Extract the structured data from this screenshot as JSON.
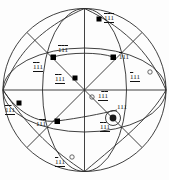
{
  "figure": {
    "type": "stereographic-projection",
    "title": "",
    "primitive_circle": {
      "cx": 84.5,
      "cy": 90,
      "r": 81.5
    },
    "colors": {
      "line": "#2b2b2b",
      "marker": "#000000",
      "background": "#ffffff"
    }
  },
  "geometry": {
    "great_circles": [
      {
        "name": "horizontal-diameter",
        "kind": "line"
      },
      {
        "name": "vertical-diameter",
        "kind": "line"
      },
      {
        "name": "diagonal-ne-sw",
        "kind": "line"
      },
      {
        "name": "diagonal-nw-se",
        "kind": "line"
      },
      {
        "name": "inner-ellipse-horizontal",
        "kind": "ellipse"
      },
      {
        "name": "inner-ellipse-vertical",
        "kind": "ellipse"
      },
      {
        "name": "arc-lens-upper",
        "kind": "arc"
      },
      {
        "name": "arc-lens-lower",
        "kind": "arc"
      }
    ]
  },
  "poles": [
    {
      "id": "p1",
      "label": [
        "1",
        "1",
        "1"
      ],
      "bars": [
        true,
        true,
        true
      ],
      "underline": true,
      "marker": "filled-square",
      "x": 99,
      "y": 19,
      "lx": 104,
      "ly": 15
    },
    {
      "id": "p2",
      "label": [
        "1",
        "1",
        "1"
      ],
      "bars": [
        true,
        true,
        true
      ],
      "underline": false,
      "marker": "filled-square",
      "x": 53,
      "y": 57,
      "lx": 58,
      "ly": 47
    },
    {
      "id": "p3",
      "label": [
        "1",
        "1",
        "1"
      ],
      "bars": [
        true,
        false,
        false
      ],
      "underline": false,
      "marker": "filled-square",
      "x": 113,
      "y": 57,
      "lx": 119,
      "ly": 54
    },
    {
      "id": "p4",
      "label": [
        "1",
        "1",
        "1"
      ],
      "bars": [
        true,
        true,
        false
      ],
      "underline": true,
      "marker": "none",
      "x": 46,
      "y": 66,
      "lx": 41,
      "ly": 64
    },
    {
      "id": "p5",
      "label": [
        "1",
        "1",
        "1"
      ],
      "bars": [
        true,
        false,
        false
      ],
      "underline": true,
      "marker": "open-circle",
      "x": 150,
      "y": 72,
      "lx": 134,
      "ly": 74
    },
    {
      "id": "p6",
      "label": [
        "1",
        "1",
        "1"
      ],
      "bars": [
        true,
        true,
        false
      ],
      "underline": true,
      "marker": "filled-square",
      "x": 75,
      "y": 78,
      "lx": 61,
      "ly": 76
    },
    {
      "id": "p7",
      "label": [
        "1",
        "1",
        "1"
      ],
      "bars": [
        false,
        true,
        true
      ],
      "underline": true,
      "marker": "open-circle",
      "x": 92,
      "y": 97,
      "lx": 98,
      "ly": 93
    },
    {
      "id": "p8",
      "label": [
        "1",
        "1",
        "1"
      ],
      "bars": [
        true,
        true,
        false
      ],
      "underline": true,
      "marker": "filled-square",
      "x": 19,
      "y": 103,
      "lx": 8,
      "ly": 107
    },
    {
      "id": "p9",
      "label": [
        "1",
        "1",
        "1"
      ],
      "bars": [
        false,
        false,
        false
      ],
      "underline": false,
      "marker": "none",
      "x": 117,
      "y": 110,
      "lx": 118,
      "ly": 105
    },
    {
      "id": "p10",
      "label": [
        "1",
        "1",
        "1"
      ],
      "bars": [
        false,
        true,
        true
      ],
      "underline": false,
      "marker": "filled-square",
      "x": 57,
      "y": 121,
      "lx": 39,
      "ly": 121
    },
    {
      "id": "p11",
      "label": [
        "1",
        "1",
        "1"
      ],
      "bars": [
        true,
        true,
        false
      ],
      "underline": true,
      "marker": "circled-star",
      "x": 113,
      "y": 118,
      "lx": 100,
      "ly": 124
    },
    {
      "id": "p12",
      "label": [
        "1",
        "1",
        "1"
      ],
      "bars": [
        true,
        false,
        false
      ],
      "underline": true,
      "marker": "open-circle",
      "x": 72,
      "y": 157,
      "lx": 57,
      "ly": 159
    }
  ],
  "markers": {
    "filled-square": "filled-square-marker",
    "open-circle": "open-circle-marker",
    "circled-star": "circled-star-marker",
    "none": "no-marker"
  }
}
